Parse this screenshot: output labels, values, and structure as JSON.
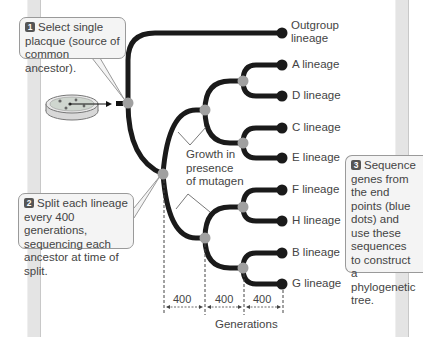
{
  "steps": [
    {
      "number": "1",
      "text": "Select single placque (source of common ancestor)."
    },
    {
      "number": "2",
      "text": "Split each lineage every 400 generations, sequencing each ancestor at time of split."
    },
    {
      "number": "3",
      "text": "Sequence genes from the end points (blue dots) and use these sequences to construct a phylogenetic tree."
    }
  ],
  "tree": {
    "outgroup": {
      "line1": "Outgroup",
      "line2": "lineage"
    },
    "lineages": [
      "A lineage",
      "D lineage",
      "C lineage",
      "E lineage",
      "F lineage",
      "H lineage",
      "B lineage",
      "G lineage"
    ],
    "mutagen_label": [
      "Growth in",
      "presence",
      "of mutagen"
    ]
  },
  "timeline": {
    "intervals": [
      "400",
      "400",
      "400"
    ],
    "axis_label": "Generations"
  },
  "colors": {
    "branch": "#1a1a1a",
    "node": "#a0a0a0",
    "leaf": "#1a1a1a",
    "callout_bg": "#f4f4f4",
    "sidebar": "#e4e4e4"
  }
}
